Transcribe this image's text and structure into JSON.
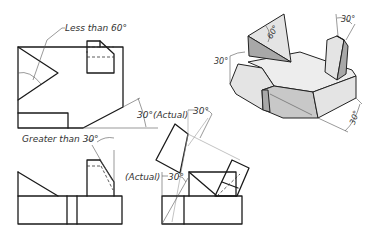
{
  "figure": {
    "type": "orthographic-and-auxiliary-views-with-isometric-pictorial",
    "views": {
      "front_view": {
        "label": "front-view"
      },
      "top_view": {
        "label": "top-view"
      },
      "auxiliary_view": {
        "label": "auxiliary-view"
      },
      "isometric_view": {
        "label": "isometric-pictorial"
      }
    },
    "annotations": {
      "less_than_60": "Less than 60°",
      "thirty_actual_top": "30°(Actual)",
      "greater_than_30": "Greater than 30°",
      "thirty_aux": "30°",
      "actual_bottom": "(Actual)",
      "thirty_bottom": "30°",
      "iso_30_left": "30°",
      "iso_60": "60°",
      "iso_30_top": "30°",
      "iso_30_right": "30°"
    }
  }
}
